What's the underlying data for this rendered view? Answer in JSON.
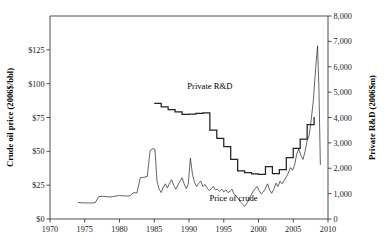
{
  "chart_data": {
    "type": "line",
    "title": "",
    "xlabel": "",
    "grid": false,
    "legend_position": "inline-annotations",
    "xlim": [
      1970,
      2010
    ],
    "xticks": [
      1970,
      1975,
      1980,
      1985,
      1990,
      1995,
      2000,
      2005,
      2010
    ],
    "xtick_labels": [
      "1970",
      "1975",
      "1980",
      "1985",
      "1990",
      "1995",
      "2000",
      "2005",
      "2010"
    ],
    "left_axis": {
      "label": "Crude oil price (2006$/bbl)",
      "ylim": [
        0,
        150
      ],
      "ticks": [
        0,
        25,
        50,
        75,
        100,
        125
      ],
      "tick_labels": [
        "$0",
        "$25",
        "$50",
        "$75",
        "$100",
        "$125"
      ]
    },
    "right_axis": {
      "label": "Private R&D (2006$m)",
      "ylim": [
        0,
        8000
      ],
      "ticks": [
        0,
        1000,
        2000,
        3000,
        4000,
        5000,
        6000,
        7000,
        8000
      ],
      "tick_labels": [
        "0",
        "1,000",
        "2,000",
        "3,000",
        "4,000",
        "5,000",
        "6,000",
        "7,000",
        "8,000"
      ]
    },
    "annotations": [
      {
        "text": "Private R&D",
        "x": 1993.0,
        "y_left": 96,
        "axis": "left"
      },
      {
        "text": "Price of crude",
        "x": 1996.4,
        "y_left": 13.5,
        "axis": "left"
      }
    ],
    "series": [
      {
        "name": "Private R&D",
        "axis": "right",
        "units": "2006$m",
        "style": "step",
        "x": [
          1985.0,
          1985.5,
          1986.0,
          1986.5,
          1987.0,
          1987.5,
          1988.0,
          1988.5,
          1989.0,
          1989.5,
          1990.0,
          1990.5,
          1991.0,
          1991.5,
          1992.0,
          1992.5,
          1993.0,
          1993.5,
          1994.0,
          1994.5,
          1995.0,
          1995.5,
          1996.0,
          1996.5,
          1997.0,
          1997.5,
          1998.0,
          1998.5,
          1999.0,
          1999.5,
          2000.0,
          2000.5,
          2001.0,
          2001.5,
          2002.0,
          2002.5,
          2003.0,
          2003.5,
          2004.0,
          2004.5,
          2005.0,
          2005.5,
          2006.0,
          2006.5,
          2007.0,
          2007.5,
          2008.0
        ],
        "values": [
          4560,
          4560,
          4420,
          4420,
          4310,
          4310,
          4220,
          4220,
          4120,
          4120,
          4130,
          4130,
          4160,
          4160,
          4180,
          4180,
          3500,
          3500,
          3180,
          3180,
          2850,
          2850,
          2350,
          2350,
          1900,
          1900,
          1830,
          1830,
          1780,
          1780,
          1760,
          1760,
          2060,
          2060,
          1790,
          1790,
          1950,
          1950,
          2420,
          2420,
          2780,
          2780,
          3150,
          3150,
          3720,
          3720,
          4020
        ]
      },
      {
        "name": "Price of crude",
        "axis": "left",
        "units": "2006$/bbl",
        "style": "line",
        "x": [
          1974.0,
          1974.5,
          1975.0,
          1975.5,
          1976.0,
          1976.5,
          1977.0,
          1977.5,
          1978.0,
          1978.5,
          1979.0,
          1979.5,
          1980.0,
          1980.5,
          1981.0,
          1981.5,
          1982.0,
          1982.5,
          1983.0,
          1983.5,
          1984.0,
          1984.4,
          1984.8,
          1985.1,
          1985.4,
          1985.7,
          1986.0,
          1986.3,
          1986.6,
          1986.9,
          1987.2,
          1987.5,
          1987.8,
          1988.1,
          1988.4,
          1988.7,
          1989.0,
          1989.3,
          1989.6,
          1989.9,
          1990.2,
          1990.5,
          1990.8,
          1991.1,
          1991.4,
          1991.7,
          1992.0,
          1992.3,
          1992.6,
          1992.9,
          1993.2,
          1993.5,
          1993.8,
          1994.1,
          1994.4,
          1994.7,
          1995.0,
          1995.3,
          1995.6,
          1995.9,
          1996.2,
          1996.5,
          1996.8,
          1997.1,
          1997.4,
          1997.7,
          1998.0,
          1998.3,
          1998.6,
          1998.9,
          1999.2,
          1999.5,
          1999.8,
          2000.1,
          2000.4,
          2000.7,
          2001.0,
          2001.3,
          2001.6,
          2001.9,
          2002.2,
          2002.5,
          2002.8,
          2003.1,
          2003.4,
          2003.7,
          2004.0,
          2004.3,
          2004.6,
          2004.9,
          2005.2,
          2005.5,
          2005.8,
          2006.1,
          2006.4,
          2006.7,
          2007.0,
          2007.3,
          2007.6,
          2007.9,
          2008.2,
          2008.5,
          2008.7,
          2008.9
        ],
        "values": [
          12.2,
          12.0,
          11.9,
          11.8,
          11.9,
          12.0,
          16.5,
          16.8,
          16.6,
          16.3,
          16.5,
          17.0,
          17.3,
          17.2,
          17.0,
          17.1,
          19.5,
          19.2,
          30.5,
          30.8,
          31.5,
          50.5,
          52.0,
          51.5,
          28.0,
          22.0,
          19.5,
          23.5,
          26.0,
          23.0,
          26.5,
          29.0,
          25.0,
          22.0,
          25.0,
          28.0,
          30.5,
          26.0,
          22.5,
          26.0,
          45.0,
          33.0,
          27.0,
          24.0,
          26.5,
          28.0,
          24.0,
          25.5,
          23.0,
          21.0,
          22.5,
          24.0,
          21.5,
          22.0,
          20.5,
          22.0,
          20.0,
          21.5,
          19.5,
          20.5,
          22.0,
          18.0,
          17.0,
          15.0,
          12.5,
          11.0,
          9.5,
          11.5,
          14.0,
          17.5,
          20.0,
          22.5,
          24.0,
          21.0,
          18.5,
          20.0,
          22.5,
          26.0,
          21.5,
          19.0,
          22.0,
          26.5,
          24.0,
          28.0,
          26.0,
          28.5,
          31.0,
          34.0,
          38.0,
          36.0,
          40.0,
          48.0,
          52.0,
          47.0,
          44.0,
          50.0,
          58.0,
          62.0,
          74.0,
          88.0,
          110.0,
          128.0,
          95.0,
          40.0
        ]
      }
    ]
  }
}
